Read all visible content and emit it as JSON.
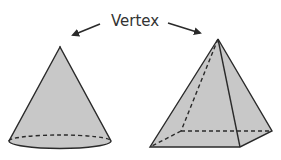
{
  "diagram": {
    "title": "Vertex",
    "label": "Vertex",
    "colors": {
      "fill": "#c8c8c8",
      "stroke": "#2a2a2a",
      "text": "#333333",
      "background": "#ffffff"
    },
    "shapes": [
      {
        "name": "cone",
        "vertex": [
          60,
          47
        ]
      },
      {
        "name": "square-pyramid",
        "vertex": [
          218,
          39
        ]
      }
    ],
    "arrows": [
      {
        "name": "arrow-to-cone-vertex",
        "from": [
          100,
          24
        ],
        "to": [
          72,
          35
        ]
      },
      {
        "name": "arrow-to-pyramid-vertex",
        "from": [
          168,
          23
        ],
        "to": [
          201,
          33
        ]
      }
    ]
  }
}
